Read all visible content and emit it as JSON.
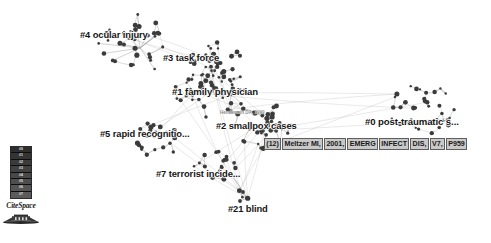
{
  "app": {
    "name": "CiteSpace",
    "view_title": "Document Co-Citation Network",
    "background_color": "#ffffff",
    "node_color": "#3b3b3b",
    "edge_color": "#9a9a9a",
    "label_color": "#161616",
    "highlight_color": "#c9c9c9"
  },
  "clusters": [
    {
      "id": "0",
      "label": "#0 post-traumatic s...",
      "x": 365,
      "y": 116,
      "font_size": 9.6,
      "cx": 424,
      "cy": 110,
      "radius": 34,
      "nodes": 34,
      "density": "medium"
    },
    {
      "id": "1",
      "label": "#1 family physician",
      "x": 172,
      "y": 86,
      "font_size": 9.6,
      "cx": 210,
      "cy": 90,
      "radius": 36,
      "nodes": 52,
      "density": "high"
    },
    {
      "id": "2",
      "label": "#2 smallpox cases",
      "x": 216,
      "y": 120,
      "font_size": 9.4,
      "cx": 266,
      "cy": 124,
      "radius": 32,
      "nodes": 40,
      "density": "high"
    },
    {
      "id": "3",
      "label": "#3 task force",
      "x": 163,
      "y": 52,
      "font_size": 9.4,
      "cx": 214,
      "cy": 62,
      "radius": 28,
      "nodes": 30,
      "density": "medium"
    },
    {
      "id": "4",
      "label": "#4 ocular injury",
      "x": 80,
      "y": 29,
      "font_size": 9.4,
      "cx": 134,
      "cy": 40,
      "radius": 30,
      "nodes": 22,
      "density": "low"
    },
    {
      "id": "5",
      "label": "#5 rapid recognitio...",
      "x": 100,
      "y": 128,
      "font_size": 9.4,
      "cx": 156,
      "cy": 140,
      "radius": 24,
      "nodes": 24,
      "density": "medium"
    },
    {
      "id": "7",
      "label": "#7 terrorist incide...",
      "x": 156,
      "y": 168,
      "font_size": 9.4,
      "cx": 216,
      "cy": 166,
      "radius": 22,
      "nodes": 20,
      "density": "medium"
    },
    {
      "id": "21",
      "label": "#21 blind",
      "x": 228,
      "y": 203,
      "font_size": 9.4,
      "cx": 243,
      "cy": 196,
      "radius": 7,
      "nodes": 3,
      "density": "low"
    }
  ],
  "node_labels": [
    {
      "text": "Henderson DA, 1999",
      "x": 220,
      "y": 110
    }
  ],
  "selected_citation": {
    "x": 264,
    "y": 138,
    "tokens": [
      "(12)",
      "Meltzer MI,",
      "2001,",
      "EMERG",
      "INFECT",
      "DIS,",
      "V7,",
      "P959"
    ],
    "full_text": "(12) Meltzer MI, 2001, EMERG INFECT DIS, V7, P959"
  },
  "legend": {
    "x": 10,
    "y": 146,
    "title": "Citation burst color scale",
    "rows": [
      "#0",
      "#1",
      "#2",
      "#3",
      "#4",
      "#5",
      "#6",
      "#7"
    ],
    "colors": [
      "#2e2e2e",
      "#343434",
      "#3b3b3b",
      "#414141",
      "#484848",
      "#4e4e4e",
      "#555555",
      "#5b5b5b"
    ]
  },
  "brand": {
    "wordmark": "CiteSpace"
  }
}
